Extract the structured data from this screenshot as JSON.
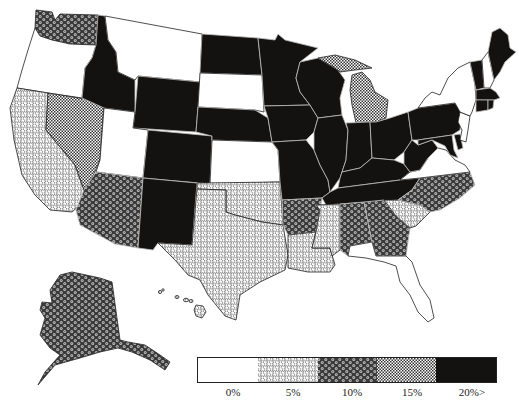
{
  "legend": {
    "classes": [
      {
        "key": "c0",
        "label": "0%",
        "pattern": "blank"
      },
      {
        "key": "c5",
        "label": "5%",
        "pattern": "hex-light"
      },
      {
        "key": "c10",
        "label": "10%",
        "pattern": "hex-dark"
      },
      {
        "key": "c15",
        "label": "15%",
        "pattern": "checker"
      },
      {
        "key": "c20",
        "label": "20%>",
        "pattern": "solid-black"
      }
    ]
  },
  "colors": {
    "black": "#141210",
    "white": "#ffffff",
    "grid": "#555555",
    "border_light": "#bdbdbd"
  },
  "states": {
    "WA": "c10",
    "OR": "c0",
    "CA": "c5",
    "NV": "c15",
    "ID": "c20",
    "MT": "c0",
    "WY": "c20",
    "UT": "c0",
    "CO": "c20",
    "AZ": "c10",
    "NM": "c20",
    "ND": "c20",
    "SD": "c0",
    "NE": "c20",
    "KS": "c0",
    "OK": "c5",
    "TX": "c5",
    "MN": "c20",
    "IA": "c20",
    "MO": "c20",
    "AR": "c10",
    "LA": "c5",
    "WI": "c20",
    "IL": "c20",
    "MI": "c15",
    "IN": "c20",
    "OH": "c20",
    "KY": "c20",
    "TN": "c20",
    "MS": "c5",
    "AL": "c10",
    "GA": "c10",
    "FL": "c0",
    "SC": "c5",
    "NC": "c10",
    "VA": "c0",
    "WV": "c20",
    "PA": "c20",
    "NY": "c0",
    "MD": "c20",
    "DE": "c20",
    "NJ": "c0",
    "CT": "c20",
    "RI": "c20",
    "MA": "c20",
    "VT": "c20",
    "NH": "c0",
    "ME": "c20",
    "AK": "c10",
    "HI": "c5"
  }
}
